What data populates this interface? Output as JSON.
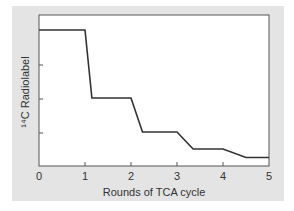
{
  "chart_data": {
    "type": "line",
    "title": "",
    "xlabel": "Rounds of TCA cycle",
    "ylabel": "¹⁴C Radiolabel",
    "xlim": [
      0,
      5
    ],
    "ylim": [
      0,
      4.4
    ],
    "x_ticks": [
      "0",
      "1",
      "2",
      "3",
      "4",
      "5"
    ],
    "y_ticks_labeled": false,
    "y_tick_positions": [
      1,
      2,
      3
    ],
    "grid": false,
    "legend": null,
    "series": [
      {
        "name": "14C radiolabel",
        "x": [
          0,
          1,
          1.15,
          2,
          2.25,
          3,
          3.35,
          4,
          4.5,
          5
        ],
        "y": [
          4,
          4,
          2,
          2,
          1,
          1,
          0.5,
          0.5,
          0.25,
          0.25
        ]
      }
    ],
    "colors": {
      "panel_background": "#e4e4e4",
      "plot_background": "#ffffff",
      "line": "#333333",
      "axis": "#555555"
    }
  }
}
